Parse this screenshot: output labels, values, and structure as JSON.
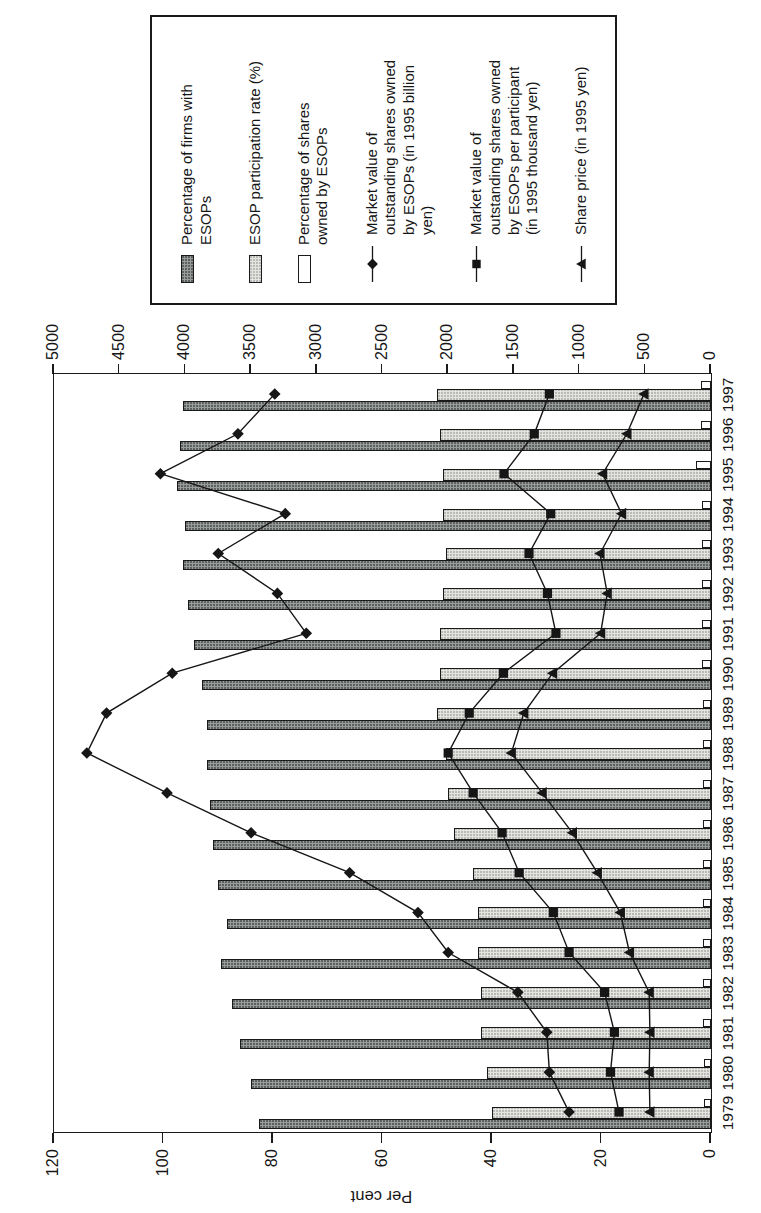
{
  "colors": {
    "bar_dark": "#989c9a",
    "bar_light": "#e4e4e1",
    "bar_white": "#ffffff",
    "line": "#161616",
    "axis": "#1a1a1a",
    "background": "#ffffff"
  },
  "figure": {
    "orientation": "rotated 90 degrees counter-clockwise (landscape chart printed on portrait page)"
  },
  "axes": {
    "left": {
      "title": "Per cent",
      "labels": [
        "0",
        "20",
        "40",
        "60",
        "80",
        "100",
        "120"
      ]
    },
    "right": {
      "labels": [
        "0",
        "500",
        "1000",
        "1500",
        "2000",
        "2500",
        "3000",
        "3500",
        "4000",
        "4500",
        "5000"
      ]
    }
  },
  "legend": {
    "items": [
      {
        "swatch": "bar-dark",
        "label": "Percentage of firms with\nESOPs"
      },
      {
        "swatch": "bar-light",
        "label": "ESOP participation rate (%)"
      },
      {
        "swatch": "bar-white",
        "label": "Percentage of shares\nowned by ESOPs"
      },
      {
        "swatch": "line-diamond",
        "marker": "diamond",
        "label": "Market value of\noutstanding shares owned\nby ESOPs (in 1995 billion\nyen)"
      },
      {
        "swatch": "line-square",
        "marker": "square",
        "label": "Market value of\noutstanding shares owned\nby ESOPs per participant\n(in 1995 thousand yen)"
      },
      {
        "swatch": "line-triangle",
        "marker": "triangle",
        "label": "Share price (in 1995 yen)"
      }
    ]
  },
  "chart_data": {
    "type": "combo (grouped bars + marker lines), rendered rotated 90° CCW",
    "categories": [
      "1979",
      "1980",
      "1981",
      "1982",
      "1983",
      "1984",
      "1985",
      "1986",
      "1987",
      "1988",
      "1989",
      "1990",
      "1991",
      "1992",
      "1993",
      "1994",
      "1995",
      "1996",
      "1997"
    ],
    "left_axis": {
      "label": "Per cent",
      "min": 0,
      "max": 120,
      "step": 20
    },
    "right_axis": {
      "min": 0,
      "max": 5000,
      "step": 500
    },
    "grid": false,
    "legend_position": "right",
    "series": [
      {
        "id": "firms-with-esops",
        "name": "Percentage of firms with ESOPs",
        "type": "bar",
        "axis": "left",
        "values": [
          82.5,
          84,
          86,
          87.5,
          89.5,
          88.5,
          90,
          91,
          91.5,
          92,
          92,
          93,
          94.5,
          95.5,
          96.5,
          96,
          97.5,
          97,
          96.5
        ]
      },
      {
        "id": "participation-rate",
        "name": "ESOP participation rate (%)",
        "type": "bar",
        "axis": "left",
        "values": [
          40,
          41,
          42,
          42,
          42.5,
          42.5,
          43.5,
          47,
          48,
          48.5,
          50,
          49.5,
          49.5,
          49,
          48.5,
          49,
          49,
          49.5,
          50
        ]
      },
      {
        "id": "shares-owned",
        "name": "Percentage of shares owned by ESOPs",
        "type": "bar",
        "axis": "left",
        "values": [
          1.3,
          1.3,
          1.4,
          1.4,
          1.4,
          1.4,
          1.5,
          1.5,
          1.5,
          1.5,
          1.5,
          1.6,
          1.6,
          1.6,
          1.6,
          1.6,
          2.7,
          1.8,
          1.8
        ]
      },
      {
        "id": "market-value-esops",
        "name": "Market value of outstanding shares owned by ESOPs (in 1995 billion yen)",
        "type": "line",
        "marker": "diamond",
        "axis": "right",
        "values": [
          1080,
          1230,
          1250,
          1470,
          2000,
          2230,
          2750,
          3500,
          4140,
          4750,
          4600,
          4100,
          3080,
          3300,
          3750,
          3240,
          4190,
          3600,
          3320
        ]
      },
      {
        "id": "market-value-per-participant",
        "name": "Market value of outstanding shares owned by ESOPs per participant (in 1995 thousand yen)",
        "type": "line",
        "marker": "square",
        "axis": "right",
        "values": [
          700,
          765,
          735,
          810,
          1080,
          1200,
          1460,
          1590,
          1810,
          2000,
          1840,
          1580,
          1180,
          1245,
          1385,
          1220,
          1575,
          1345,
          1230
        ]
      },
      {
        "id": "share-price",
        "name": "Share price (in 1995 yen)",
        "type": "line",
        "marker": "triangle",
        "axis": "right",
        "values": [
          465,
          470,
          465,
          470,
          620,
          690,
          865,
          1055,
          1285,
          1520,
          1425,
          1205,
          840,
          790,
          845,
          680,
          825,
          640,
          510
        ]
      }
    ]
  }
}
